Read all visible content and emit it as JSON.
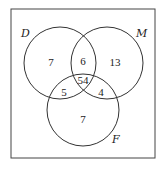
{
  "diagram": {
    "type": "venn-3",
    "sets": [
      {
        "name": "D",
        "label": "D"
      },
      {
        "name": "M",
        "label": "M"
      },
      {
        "name": "F",
        "label": "F"
      }
    ],
    "regions": {
      "D_only": "7",
      "M_only": "13",
      "F_only": "7",
      "D_M": "6",
      "D_F": "5",
      "M_F": "4",
      "D_M_F": "54"
    },
    "colors": {
      "stroke": "#333333",
      "background": "#ffffff"
    }
  }
}
